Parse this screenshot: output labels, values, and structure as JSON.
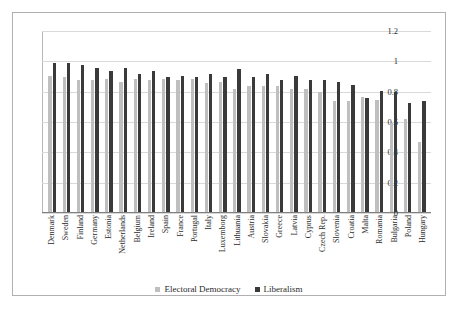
{
  "chart_data": {
    "type": "bar",
    "title": "",
    "subtitle": "",
    "xlabel": "",
    "ylabel": "",
    "ylim": [
      0,
      1.2
    ],
    "yticks": [
      0,
      0.2,
      0.4,
      0.6,
      0.8,
      1,
      1.2
    ],
    "ytick_labels": [
      "0",
      "0.2",
      "0.4",
      "0.6",
      "0.8",
      "1",
      "1.2"
    ],
    "grid": true,
    "legend_position": "bottom",
    "categories": [
      "Denmark",
      "Sweden",
      "Finland",
      "Germany",
      "Estonia",
      "Netherlands",
      "Belgium",
      "Ireland",
      "Spain",
      "France",
      "Portugal",
      "Italy",
      "Luxemborg",
      "Lithuania",
      "Austria",
      "Slovakia",
      "Greece",
      "Latvia",
      "Cyprus",
      "Czech Rep.",
      "Slovenia",
      "Croatia",
      "Malta",
      "Romania",
      "Bulgaria",
      "Poland",
      "Hungary"
    ],
    "series": [
      {
        "name": "Electoral Democracy",
        "color": "#bfbfbf",
        "values": [
          0.9,
          0.89,
          0.87,
          0.87,
          0.88,
          0.86,
          0.88,
          0.87,
          0.88,
          0.87,
          0.88,
          0.85,
          0.86,
          0.81,
          0.83,
          0.83,
          0.83,
          0.81,
          0.81,
          0.79,
          0.73,
          0.73,
          0.76,
          0.74,
          0.59,
          0.61,
          0.46
        ]
      },
      {
        "name": "Liberalism",
        "color": "#3a3a3a",
        "values": [
          0.98,
          0.98,
          0.97,
          0.95,
          0.93,
          0.95,
          0.91,
          0.93,
          0.89,
          0.9,
          0.89,
          0.91,
          0.89,
          0.94,
          0.89,
          0.91,
          0.87,
          0.9,
          0.87,
          0.87,
          0.86,
          0.84,
          0.75,
          0.8,
          0.79,
          0.72,
          0.73
        ]
      }
    ]
  },
  "legend": {
    "items": [
      {
        "label": "Electoral Democracy",
        "color": "#bfbfbf",
        "marker": "square-marker"
      },
      {
        "label": "Liberalism",
        "color": "#3a3a3a",
        "marker": "square-marker"
      }
    ]
  }
}
